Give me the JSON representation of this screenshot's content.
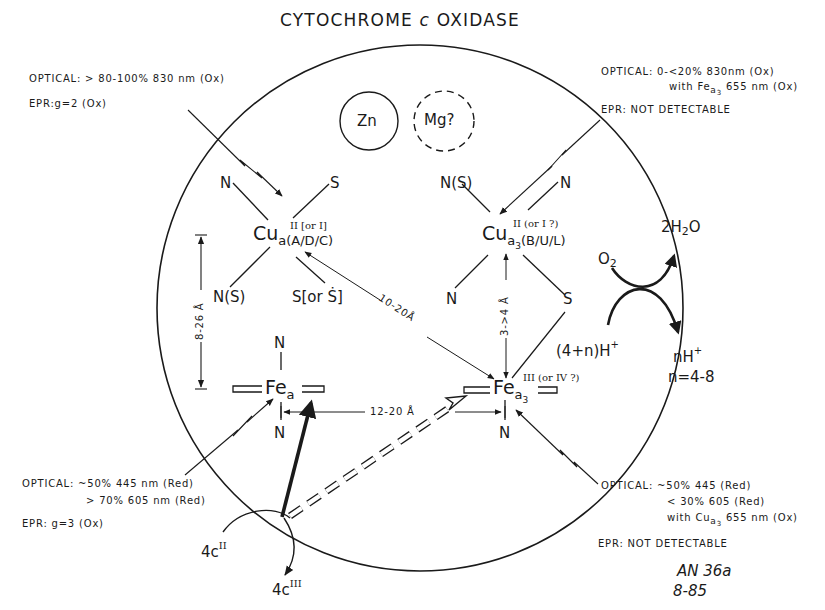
{
  "title": {
    "pre": "CYTOCHROME ",
    "italic": "c",
    "post": " OXIDASE"
  },
  "metals": {
    "zn": "Zn",
    "mg": "Mg?"
  },
  "cua": {
    "symbol": "Cu",
    "subscript": "a(A/D/C)",
    "oxidation": "II [or I]",
    "ligands": [
      "N",
      "S",
      "N(S)",
      "S[or Ṡ]"
    ],
    "optical_label": "OPTICAL:",
    "optical_value": "> 80-100% 830 nm (Ox)",
    "epr": "EPR:g=2 (Ox)"
  },
  "cua3": {
    "symbol": "Cu",
    "subscript": "a",
    "subscript2": "3",
    "subscript_rest": "(B/U/L)",
    "oxidation": "II (or I ?)",
    "ligands": [
      "N(S)",
      "N",
      "N",
      "S"
    ],
    "optical_label": "OPTICAL:",
    "optical_value": "0-<20% 830nm (Ox)",
    "optical_line2_pre": "with Fe",
    "optical_line2_sub": "a",
    "optical_line2_sub2": "3",
    "optical_line2_post": " 655 nm (Ox)",
    "epr": "EPR: NOT DETECTABLE"
  },
  "fea": {
    "symbol": "Fe",
    "subscript": "a",
    "ligands": [
      "N",
      "N"
    ],
    "optical_label": "OPTICAL:",
    "optical_line1": "~50% 445 nm (Red)",
    "optical_line2": "> 70% 605 nm (Red)",
    "epr": "EPR: g=3 (Ox)"
  },
  "fea3": {
    "symbol": "Fe",
    "subscript": "a",
    "subscript2": "3",
    "oxidation": "III (or IV ?)",
    "ligands": [
      "N"
    ],
    "optical_label": "OPTICAL:",
    "optical_line1": "~50% 445 (Red)",
    "optical_line2": "< 30% 605 (Red)",
    "optical_line3_pre": "with Cu",
    "optical_line3_sub": "a",
    "optical_line3_sub2": "3",
    "optical_line3_post": " 655 nm (Ox)",
    "epr": "EPR: NOT DETECTABLE"
  },
  "distances": {
    "cua_fea": "8-26 Å",
    "cua_fea3": "10-20Å",
    "cua3_fea3": "3->4 Å",
    "fea_fea3": "12-20 Å"
  },
  "reaction": {
    "o2": "O",
    "o2_sub": "2",
    "water_pre": "2H",
    "water_sub": "2",
    "water_post": "O",
    "protons_in": "(4+n)H",
    "protons_in_sup": "+",
    "protons_out": "nH",
    "protons_out_sup": "+",
    "n_range": "n=4-8"
  },
  "cytc": {
    "reduced_coef": "4c",
    "reduced_sup": "II",
    "oxidized_coef": "4c",
    "oxidized_sup": "III"
  },
  "annotation": {
    "line1": "AN 36a",
    "line2": "8-85"
  },
  "colors": {
    "ink": "#1a1a1a",
    "background": "#ffffff"
  }
}
